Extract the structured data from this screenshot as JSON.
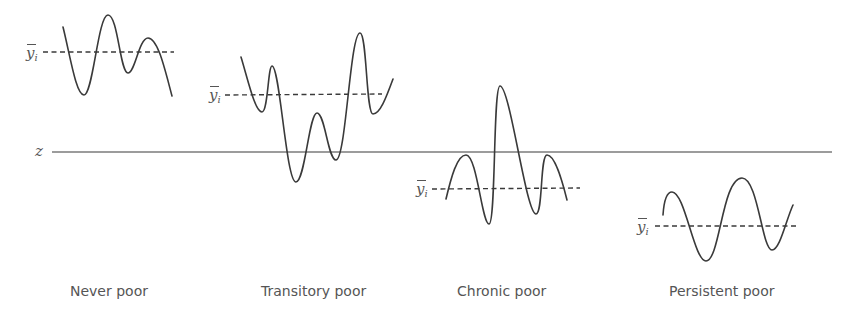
{
  "diagram": {
    "poverty_line_label": "z",
    "mean_symbol": "y",
    "mean_subscript": "i",
    "panels": [
      {
        "id": "never",
        "caption": "Never poor"
      },
      {
        "id": "transitory",
        "caption": "Transitory poor"
      },
      {
        "id": "chronic",
        "caption": "Chronic poor"
      },
      {
        "id": "persistent",
        "caption": "Persistent poor"
      }
    ],
    "colors": {
      "line": "#3a3a3a",
      "text": "#555555",
      "background": "#ffffff"
    }
  }
}
